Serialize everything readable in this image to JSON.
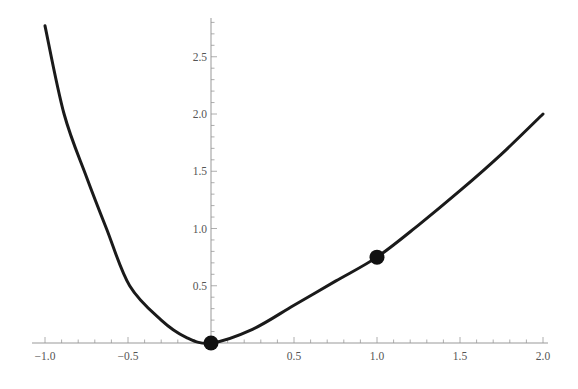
{
  "chart_data": {
    "type": "line",
    "title": "",
    "xlabel": "",
    "ylabel": "",
    "xlim": [
      -1.0,
      2.0
    ],
    "ylim": [
      0,
      2.8
    ],
    "grid": false,
    "x_ticks": [
      "-1.0",
      "-0.5",
      "0.5",
      "1.0",
      "1.5",
      "2.0"
    ],
    "y_ticks": [
      "0.5",
      "1.0",
      "1.5",
      "2.0",
      "2.5"
    ],
    "series": [
      {
        "name": "curve",
        "color": "#1a1a1a",
        "x": [
          -1.0,
          -0.885,
          -0.75,
          -0.63,
          -0.49,
          -0.3,
          -0.15,
          0.0,
          0.25,
          0.5,
          0.75,
          1.0,
          1.25,
          1.5,
          1.75,
          2.0
        ],
        "y": [
          2.77,
          2.0,
          1.45,
          1.0,
          0.5,
          0.2,
          0.05,
          0.0,
          0.12,
          0.33,
          0.54,
          0.75,
          1.03,
          1.33,
          1.65,
          2.0
        ]
      }
    ],
    "points": [
      {
        "x": 0.0,
        "y": 0.0
      },
      {
        "x": 1.0,
        "y": 0.75
      }
    ]
  }
}
